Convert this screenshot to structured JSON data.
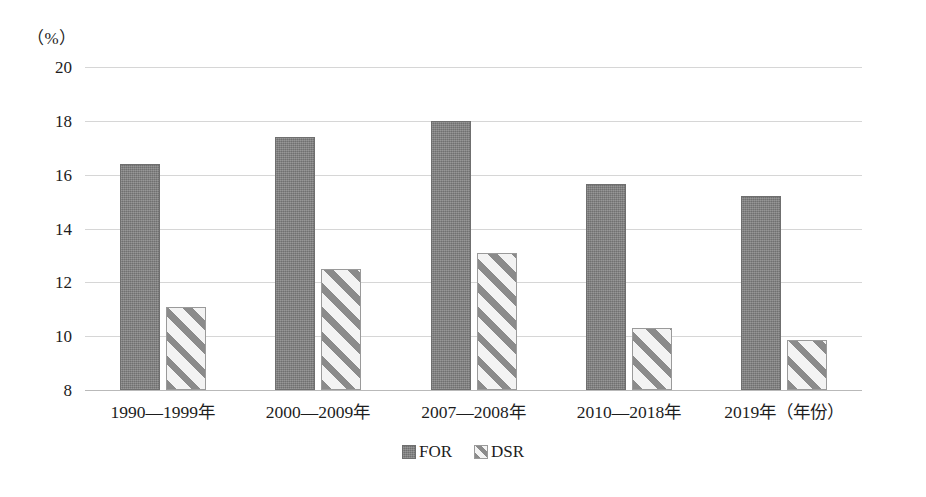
{
  "chart_data": {
    "type": "bar",
    "title": "",
    "subtitle": "",
    "xlabel": "年份",
    "ylabel": "",
    "y_unit_label": "（%）",
    "x_axis_caption": "2019年（年份）",
    "categories": [
      "1990—1999年",
      "2000—2009年",
      "2007—2008年",
      "2010—2018年",
      "2019年（年份）"
    ],
    "series": [
      {
        "name": "FOR",
        "values": [
          16.4,
          17.4,
          18.0,
          15.65,
          15.2
        ],
        "color": "#808080",
        "pattern": "solid-texture"
      },
      {
        "name": "DSR",
        "values": [
          11.1,
          12.5,
          13.1,
          10.3,
          9.85
        ],
        "color": "#f2f2f2",
        "pattern": "diagonal-stripes"
      }
    ],
    "ylim": [
      8,
      20
    ],
    "ytick_values": [
      8,
      10,
      12,
      14,
      16,
      18,
      20
    ],
    "ytick_labels": [
      "8",
      "10",
      "12",
      "14",
      "16",
      "18",
      "20"
    ],
    "grid": true,
    "grid_axis": "y",
    "legend_position": "bottom-center"
  },
  "legend": {
    "items": [
      {
        "label": "FOR"
      },
      {
        "label": "DSR"
      }
    ]
  }
}
